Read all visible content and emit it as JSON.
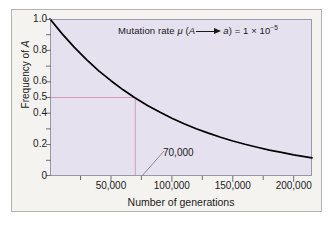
{
  "figure": {
    "background_color": "#ffffff",
    "card_color": "#f4f3f0",
    "card_border_color": "#b4b2ae"
  },
  "chart_data": {
    "type": "line",
    "title": "",
    "annotation_plain": "Mutation rate μ (A ⟶ a) = 1 × 10⁻⁵",
    "annotation_parts": {
      "lead": "Mutation rate ",
      "mu": "μ",
      "open": " (",
      "from_allele": "A",
      "to_allele": "a",
      "close": ") = 1 ",
      "times": "×",
      "base": " 10",
      "exponent": "−5"
    },
    "xlabel": "Number of generations",
    "ylabel_parts": {
      "text": "Frequency of ",
      "italic": "A"
    },
    "ylabel": "Frequency of A",
    "xlim": [
      0,
      215000
    ],
    "ylim": [
      0,
      1.0
    ],
    "grid": false,
    "legend": "none",
    "plot_bg_color": "#e5e1ef",
    "curve_color": "#000000",
    "guide_color": "#d79bb8",
    "x_ticks_major": [
      50000,
      100000,
      150000,
      200000
    ],
    "x_tick_labels": [
      "50,000",
      "100,000",
      "150,000",
      "200,000"
    ],
    "x_ticks_minor": [
      25000,
      75000,
      125000,
      175000
    ],
    "y_ticks": [
      0,
      0.2,
      0.4,
      0.5,
      0.6,
      0.8,
      1.0
    ],
    "y_tick_labels": [
      "0",
      "0.2",
      "0.4",
      "0.5",
      "0.6",
      "0.8",
      "1.0"
    ],
    "mutation_rate": 1e-05,
    "equation": "p_t = e^(-mu*t)",
    "series": [
      {
        "name": "Frequency of A",
        "x": [
          0,
          10000,
          20000,
          30000,
          40000,
          50000,
          60000,
          69315,
          80000,
          90000,
          100000,
          110000,
          120000,
          130000,
          140000,
          150000,
          160000,
          170000,
          180000,
          190000,
          200000,
          215000
        ],
        "values": [
          1.0,
          0.905,
          0.819,
          0.741,
          0.67,
          0.607,
          0.549,
          0.5,
          0.449,
          0.407,
          0.368,
          0.333,
          0.301,
          0.273,
          0.247,
          0.223,
          0.202,
          0.183,
          0.165,
          0.15,
          0.135,
          0.116
        ]
      }
    ],
    "callout": {
      "label": "70,000",
      "x_value": 70000,
      "y_value": 0.5,
      "guide_y": 0.5,
      "description": "half-life marker: frequency of A falls to 0.5 at 70,000 generations"
    }
  }
}
